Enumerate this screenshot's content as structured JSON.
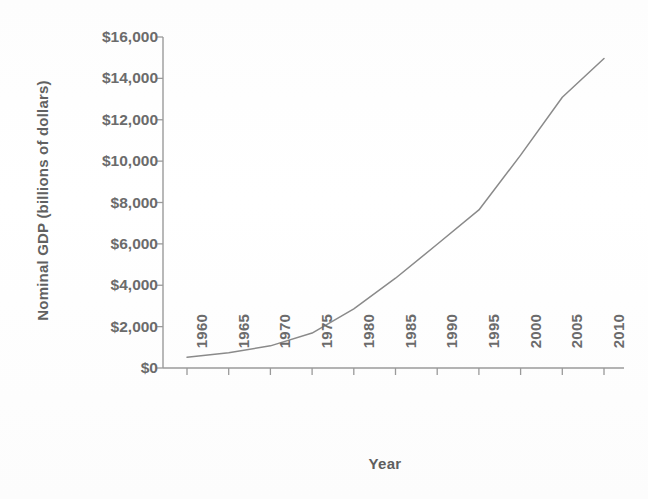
{
  "chart_data": {
    "type": "line",
    "title": "",
    "xlabel": "Year",
    "ylabel": "Nominal GDP (billions of dollars)",
    "x": [
      1960,
      1965,
      1970,
      1975,
      1980,
      1985,
      1990,
      1995,
      2000,
      2005,
      2010
    ],
    "values": [
      520,
      740,
      1070,
      1690,
      2860,
      4340,
      5980,
      7640,
      10290,
      13090,
      14960
    ],
    "series": [
      {
        "name": "Nominal GDP",
        "values": [
          520,
          740,
          1070,
          1690,
          2860,
          4340,
          5980,
          7640,
          10290,
          13090,
          14960
        ]
      }
    ],
    "xlim": [
      1960,
      2010
    ],
    "ylim": [
      0,
      16000
    ],
    "xticks": [
      1960,
      1965,
      1970,
      1975,
      1980,
      1985,
      1990,
      1995,
      2000,
      2005,
      2010
    ],
    "xticklabels": [
      "1960",
      "1965",
      "1970",
      "1975",
      "1980",
      "1985",
      "1990",
      "1995",
      "2000",
      "2005",
      "2010"
    ],
    "yticks": [
      0,
      2000,
      4000,
      6000,
      8000,
      10000,
      12000,
      14000,
      16000
    ],
    "yticklabels": [
      "$0",
      "$2,000",
      "$4,000",
      "$6,000",
      "$8,000",
      "$10,000",
      "$12,000",
      "$14,000",
      "$16,000"
    ],
    "grid": false,
    "legend": null,
    "legend_position": "none",
    "line_color": "#8a8a8a",
    "axis_color": "#9a9a9a",
    "text_color": "#6b6b6b",
    "background_color": "#ffffff"
  }
}
